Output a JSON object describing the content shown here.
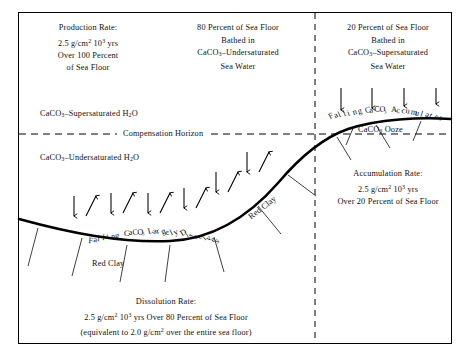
{
  "figure": {
    "title_hidden": "Carbonate Compensation Depth Schematic",
    "background_color": "#ffffff",
    "line_color": "#000000"
  },
  "blocks": {
    "production": {
      "line1": "Production Rate:",
      "line2_pre": "2.5 g/cm",
      "line2_sup1": "2",
      "line2_mid": " 10",
      "line2_sup2": "3",
      "line2_post": " yrs",
      "line3": "Over 100 Percent",
      "line4": "of Sea Floor"
    },
    "center_top": {
      "line1": "80 Percent of Sea Floor",
      "line2": "Bathed in",
      "line3_pre": "CaCO",
      "line3_sub": "3",
      "line3_post": "–Undersaturated",
      "line4": "Sea Water"
    },
    "right_top": {
      "line1": "20 Percent of Sea Floor",
      "line2": "Bathed in",
      "line3_pre": "CaCO",
      "line3_sub": "3",
      "line3_post": "–Supersaturated",
      "line4": "Sea Water"
    },
    "accumulation": {
      "line1": "Accumulation Rate:",
      "line2_pre": "2.5 g/cm",
      "line2_sup1": "2",
      "line2_mid": " 10",
      "line2_sup2": "3",
      "line2_post": " yrs",
      "line3": "Over 20 Percent of Sea Floor"
    },
    "dissolution": {
      "line1": "Dissolution Rate:",
      "line2_pre": "2.5 g/cm",
      "line2_sup1": "2",
      "line2_mid": " 10",
      "line2_sup2": "3",
      "line2_post": " yrs Over 80 Percent of Sea Floor",
      "line3_pre": "(equivalent to 2.0 g/cm",
      "line3_sup": "2",
      "line3_post": " over the entire sea floor)"
    }
  },
  "labels": {
    "supersaturated_water_pre": "CaCO",
    "supersaturated_water_sub": "3",
    "supersaturated_water_post": "–Supersaturated H",
    "supersaturated_water_sub2": "2",
    "supersaturated_water_end": "O",
    "undersaturated_water_pre": "CaCO",
    "undersaturated_water_sub": "3",
    "undersaturated_water_post": "–Undersaturated H",
    "undersaturated_water_sub2": "2",
    "undersaturated_water_end": "O",
    "compensation_horizon": "Compensation Horizon",
    "ooze_pre": "CaCO",
    "ooze_sub": "3",
    "ooze_post": " Ooze",
    "red_clay_flat": "Red  Clay",
    "red_clay_slope": "Red Clay"
  },
  "curved_labels": {
    "accumulates": [
      {
        "ch": "F",
        "rot": -27
      },
      {
        "ch": "a",
        "rot": -25
      },
      {
        "ch": "l",
        "rot": -23
      },
      {
        "ch": "l",
        "rot": -22
      },
      {
        "ch": "i",
        "rot": -20
      },
      {
        "ch": "n",
        "rot": -18
      },
      {
        "ch": "g",
        "rot": -16
      },
      {
        "ch": " ",
        "rot": -14
      },
      {
        "ch": "C",
        "rot": -12
      },
      {
        "ch": "a",
        "rot": -10
      },
      {
        "ch": "C",
        "rot": -8
      },
      {
        "ch": "O",
        "rot": -6
      },
      {
        "ch": "₃",
        "rot": -4
      },
      {
        "ch": " ",
        "rot": -2
      },
      {
        "ch": "A",
        "rot": 1
      },
      {
        "ch": "c",
        "rot": 4
      },
      {
        "ch": "c",
        "rot": 7
      },
      {
        "ch": "u",
        "rot": 10
      },
      {
        "ch": "m",
        "rot": 13
      },
      {
        "ch": "u",
        "rot": 16
      },
      {
        "ch": "l",
        "rot": 19
      },
      {
        "ch": "a",
        "rot": 22
      },
      {
        "ch": "t",
        "rot": 25
      },
      {
        "ch": "e",
        "rot": 28
      },
      {
        "ch": "s",
        "rot": 31
      }
    ],
    "dissolves": [
      {
        "ch": "F",
        "rot": 5
      },
      {
        "ch": "a",
        "rot": 5
      },
      {
        "ch": "l",
        "rot": 4
      },
      {
        "ch": "l",
        "rot": 4
      },
      {
        "ch": "i",
        "rot": 3
      },
      {
        "ch": "n",
        "rot": 2
      },
      {
        "ch": "g",
        "rot": 1
      },
      {
        "ch": " ",
        "rot": 0
      },
      {
        "ch": " ",
        "rot": -1
      },
      {
        "ch": "C",
        "rot": -2
      },
      {
        "ch": "a",
        "rot": -4
      },
      {
        "ch": "C",
        "rot": -6
      },
      {
        "ch": "O",
        "rot": -8
      },
      {
        "ch": "₃",
        "rot": -10
      },
      {
        "ch": " ",
        "rot": -12
      },
      {
        "ch": "L",
        "rot": -15
      },
      {
        "ch": "a",
        "rot": -17
      },
      {
        "ch": "r",
        "rot": -19
      },
      {
        "ch": "g",
        "rot": -21
      },
      {
        "ch": "e",
        "rot": -23
      },
      {
        "ch": "l",
        "rot": -25
      },
      {
        "ch": "y",
        "rot": -27
      },
      {
        "ch": " ",
        "rot": -29
      },
      {
        "ch": "D",
        "rot": -31
      },
      {
        "ch": "i",
        "rot": -33
      },
      {
        "ch": "s",
        "rot": -35
      },
      {
        "ch": "s",
        "rot": -37
      },
      {
        "ch": "o",
        "rot": -39
      },
      {
        "ch": "l",
        "rot": -41
      },
      {
        "ch": "v",
        "rot": -43
      },
      {
        "ch": "e",
        "rot": -45
      },
      {
        "ch": "s",
        "rot": -47
      }
    ]
  },
  "geometry": {
    "seafloor_path": "M 19,219 C 70,233 120,243 170,241 C 215,239 250,215 278,183 C 300,157 322,138 348,129 C 378,119 420,117 451,119",
    "compensation_horizon_y": 134,
    "vertical_divider_x": 315,
    "arrow_pairs_dissolve": [
      {
        "x": 74,
        "y": 200
      },
      {
        "x": 111,
        "y": 196
      },
      {
        "x": 148,
        "y": 196
      },
      {
        "x": 184,
        "y": 192
      },
      {
        "x": 215,
        "y": 178
      },
      {
        "x": 245,
        "y": 158
      }
    ],
    "arrows_accumulate_x": [
      341,
      372,
      404,
      434
    ],
    "ticks_upper_right_y_top": 88,
    "leaders_seafloor": [
      {
        "x1": 38,
        "y1": 228,
        "x2": 30,
        "y2": 262
      },
      {
        "x1": 80,
        "y1": 238,
        "x2": 70,
        "y2": 272
      },
      {
        "x1": 125,
        "y1": 245,
        "x2": 118,
        "y2": 278
      },
      {
        "x1": 168,
        "y1": 245,
        "x2": 163,
        "y2": 278
      },
      {
        "x1": 213,
        "y1": 237,
        "x2": 222,
        "y2": 268
      },
      {
        "x1": 258,
        "y1": 206,
        "x2": 278,
        "y2": 232
      },
      {
        "x1": 290,
        "y1": 172,
        "x2": 315,
        "y2": 192
      },
      {
        "x1": 337,
        "y1": 136,
        "x2": 350,
        "y2": 158
      },
      {
        "x1": 375,
        "y1": 124,
        "x2": 388,
        "y2": 146
      }
    ],
    "ticks_ooze": [
      {
        "x1": 352,
        "y1": 124,
        "x2": 345,
        "y2": 142
      },
      {
        "x1": 419,
        "y1": 120,
        "x2": 412,
        "y2": 140
      }
    ]
  }
}
